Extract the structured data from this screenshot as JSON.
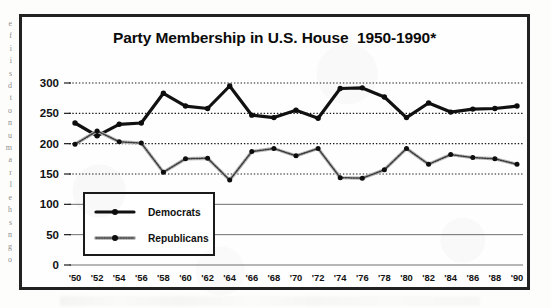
{
  "chart_data": {
    "type": "line",
    "title": "Party Membership in U.S. House  1950-1990*",
    "xlabel": "",
    "ylabel": "",
    "ylim": [
      0,
      300
    ],
    "yticks": [
      0,
      50,
      100,
      150,
      200,
      250,
      300
    ],
    "ytick_labels": [
      "0",
      "50",
      "100",
      "150",
      "200",
      "250",
      "300"
    ],
    "grid": true,
    "grid_style": "dotted",
    "legend_position": "lower-left-inside",
    "categories": [
      "'50",
      "'52",
      "'54",
      "'56",
      "'58",
      "'60",
      "'62",
      "'64",
      "'66",
      "'68",
      "'70",
      "'72",
      "'74",
      "'76",
      "'78",
      "'80",
      "'82",
      "'84",
      "'86",
      "'88",
      "'90"
    ],
    "x": [
      1950,
      1952,
      1954,
      1956,
      1958,
      1960,
      1962,
      1964,
      1966,
      1968,
      1970,
      1972,
      1974,
      1976,
      1978,
      1980,
      1982,
      1984,
      1986,
      1988,
      1990
    ],
    "series": [
      {
        "name": "Democrats",
        "color": "#111111",
        "style": "solid-thick",
        "marker": "circle",
        "values": [
          234,
          213,
          232,
          234,
          283,
          262,
          258,
          295,
          247,
          243,
          255,
          242,
          291,
          292,
          277,
          243,
          267,
          252,
          257,
          258,
          262
        ]
      },
      {
        "name": "Republicans",
        "color": "#8a8a8a",
        "style": "dotted-thin",
        "marker": "circle",
        "values": [
          199,
          221,
          203,
          201,
          153,
          175,
          176,
          140,
          187,
          192,
          180,
          192,
          144,
          143,
          157,
          192,
          166,
          182,
          177,
          175,
          166
        ]
      }
    ],
    "footnote_marker": "*"
  },
  "legend": {
    "entries": [
      {
        "label": "Democrats"
      },
      {
        "label": "Republicans"
      }
    ]
  },
  "scan_artifacts": {
    "left_margin_fragments": [
      "e",
      "f",
      "i",
      "i",
      "s",
      "d",
      "t",
      "o",
      "n",
      "u",
      "m",
      "a",
      "r",
      "l",
      "e",
      "h",
      "s",
      "n",
      "g",
      "o"
    ]
  }
}
